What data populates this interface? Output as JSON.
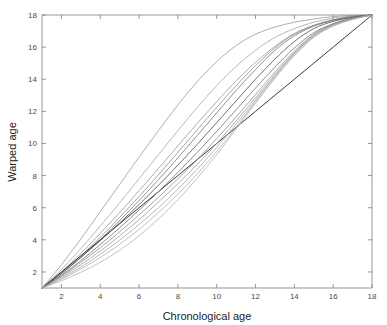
{
  "figure": {
    "background_color": "#ffffff",
    "axis_color": "#8a8a8a",
    "text_color": "#1c1c1c",
    "tick_text_color": "#4a4a4a"
  },
  "chart_data": {
    "type": "line",
    "title": "",
    "xlabel": "Chronological age",
    "ylabel": "Warped age",
    "xlim": [
      1,
      18
    ],
    "ylim": [
      1,
      18
    ],
    "xticks": [
      2,
      4,
      6,
      8,
      10,
      12,
      14,
      16,
      18
    ],
    "xticklabels": [
      "2",
      "4",
      "6",
      "8",
      "10",
      "12",
      "14",
      "16",
      "18"
    ],
    "yticks": [
      2,
      4,
      6,
      8,
      10,
      12,
      14,
      16,
      18
    ],
    "yticklabels": [
      "2",
      "4",
      "6",
      "8",
      "10",
      "12",
      "14",
      "16",
      "18"
    ],
    "grid": false,
    "legend": null,
    "legend_position": "none",
    "x": [
      1,
      2,
      3,
      4,
      5,
      6,
      7,
      8,
      9,
      10,
      11,
      12,
      13,
      14,
      15,
      16,
      17,
      18
    ],
    "series": [
      {
        "name": "warp-1",
        "color": "#8d8d8d",
        "width": 0.7,
        "values": [
          1.0,
          2.45,
          4.05,
          5.75,
          7.45,
          9.15,
          10.8,
          12.4,
          13.85,
          15.1,
          16.1,
          16.8,
          17.25,
          17.55,
          17.75,
          17.9,
          17.97,
          18.0
        ]
      },
      {
        "name": "warp-2",
        "color": "#9a9a9a",
        "width": 0.7,
        "values": [
          1.0,
          2.15,
          3.45,
          4.85,
          6.3,
          7.8,
          9.3,
          10.8,
          12.25,
          13.6,
          14.8,
          15.8,
          16.6,
          17.15,
          17.55,
          17.8,
          17.94,
          18.0
        ]
      },
      {
        "name": "warp-3",
        "color": "#8a8a8a",
        "width": 0.7,
        "values": [
          1.0,
          2.0,
          3.15,
          4.4,
          5.7,
          7.05,
          8.45,
          9.85,
          11.25,
          12.6,
          13.9,
          15.05,
          16.05,
          16.85,
          17.35,
          17.7,
          17.9,
          18.0
        ]
      },
      {
        "name": "warp-4",
        "color": "#7e7e7e",
        "width": 0.7,
        "values": [
          1.0,
          1.95,
          3.0,
          4.15,
          5.4,
          6.7,
          8.05,
          9.45,
          10.85,
          12.25,
          13.6,
          14.85,
          15.95,
          16.8,
          17.35,
          17.7,
          17.9,
          18.0
        ]
      },
      {
        "name": "warp-5",
        "color": "#757575",
        "width": 0.8,
        "values": [
          1.0,
          1.9,
          2.9,
          4.0,
          5.2,
          6.45,
          7.75,
          9.1,
          10.5,
          11.9,
          13.3,
          14.6,
          15.8,
          16.7,
          17.3,
          17.66,
          17.88,
          18.0
        ]
      },
      {
        "name": "warp-6",
        "color": "#5e5e5e",
        "width": 0.9,
        "values": [
          1.0,
          1.9,
          2.9,
          3.95,
          5.05,
          6.2,
          7.4,
          8.65,
          9.95,
          11.3,
          12.65,
          14.0,
          15.25,
          16.35,
          17.15,
          17.6,
          17.85,
          18.0
        ]
      },
      {
        "name": "warp-identity",
        "color": "#3a3a3a",
        "width": 1.0,
        "values": [
          1.0,
          2.0,
          3.0,
          4.0,
          5.0,
          6.0,
          7.0,
          8.0,
          9.0,
          10.0,
          11.0,
          12.0,
          13.0,
          14.0,
          15.0,
          16.0,
          17.0,
          18.0
        ]
      },
      {
        "name": "warp-7",
        "color": "#6e6e6e",
        "width": 0.8,
        "values": [
          1.0,
          1.8,
          2.7,
          3.7,
          4.75,
          5.85,
          7.0,
          8.2,
          9.45,
          10.75,
          12.1,
          13.45,
          14.75,
          15.95,
          16.9,
          17.45,
          17.8,
          18.0
        ]
      },
      {
        "name": "warp-8",
        "color": "#808080",
        "width": 0.7,
        "values": [
          1.0,
          1.75,
          2.6,
          3.5,
          4.5,
          5.55,
          6.65,
          7.8,
          9.0,
          10.3,
          11.65,
          13.05,
          14.45,
          15.75,
          16.8,
          17.45,
          17.8,
          18.0
        ]
      },
      {
        "name": "warp-9",
        "color": "#8d8d8d",
        "width": 0.7,
        "values": [
          1.0,
          1.7,
          2.45,
          3.3,
          4.25,
          5.25,
          6.35,
          7.5,
          8.7,
          10.0,
          11.4,
          12.85,
          14.3,
          15.65,
          16.75,
          17.4,
          17.78,
          18.0
        ]
      },
      {
        "name": "warp-10",
        "color": "#9a9a9a",
        "width": 0.7,
        "values": [
          1.0,
          1.62,
          2.3,
          3.1,
          3.98,
          4.95,
          6.0,
          7.15,
          8.4,
          9.75,
          11.2,
          12.7,
          14.2,
          15.6,
          16.7,
          17.38,
          17.76,
          18.0
        ]
      },
      {
        "name": "warp-11",
        "color": "#a3a3a3",
        "width": 0.7,
        "values": [
          1.0,
          1.55,
          2.18,
          2.9,
          3.72,
          4.65,
          5.7,
          6.85,
          8.1,
          9.5,
          11.0,
          12.6,
          14.15,
          15.55,
          16.66,
          17.34,
          17.74,
          18.0
        ]
      },
      {
        "name": "warp-12",
        "color": "#a8a8a8",
        "width": 0.7,
        "values": [
          1.0,
          1.45,
          1.98,
          2.6,
          3.35,
          4.25,
          5.3,
          6.5,
          7.85,
          9.3,
          10.9,
          12.5,
          14.05,
          15.45,
          16.6,
          17.3,
          17.72,
          18.0
        ]
      }
    ]
  }
}
